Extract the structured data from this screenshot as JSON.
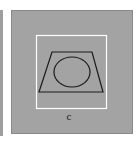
{
  "figure": {
    "label": "c",
    "colors": {
      "background": "#ffffff",
      "panel": "#a3a3a3",
      "panel_border": "#8a8a8a",
      "frame": "#ffffff",
      "shape_stroke": "#1a1a1a"
    },
    "shapes": [
      {
        "type": "square-frame",
        "description": "white square outline"
      },
      {
        "type": "trapezoid",
        "description": "trapezoid wider at bottom"
      },
      {
        "type": "ellipse",
        "description": "ellipse inside trapezoid"
      }
    ]
  }
}
